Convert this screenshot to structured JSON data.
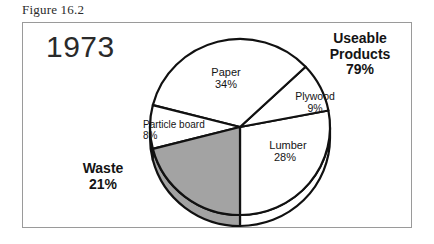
{
  "caption": "Figure 16.2",
  "year": "1973",
  "groups": {
    "useable": {
      "name": "Useable",
      "name2": "Products",
      "pct": "79%"
    },
    "waste": {
      "name": "Waste",
      "pct": "21%"
    }
  },
  "colors": {
    "waste_fill": "#a3a3a3",
    "usable_fill": "#ffffff",
    "outline": "#111111",
    "frame": "#9a9a9a",
    "text": "#141414"
  },
  "chart_data": {
    "type": "pie",
    "title": "1973",
    "xlabel": "",
    "ylabel": "",
    "legend": "none",
    "grid": false,
    "categories": [
      "Lumber",
      "Plywood",
      "Paper",
      "Particle board",
      "Waste"
    ],
    "values": [
      28,
      9,
      34,
      8,
      21
    ],
    "labels": [
      "Lumber 28%",
      "Plywood 9%",
      "Paper 34%",
      "Particle board 8%",
      "Waste 21%"
    ],
    "slice_fills": [
      "#ffffff",
      "#ffffff",
      "#ffffff",
      "#ffffff",
      "#a3a3a3"
    ],
    "annotations": [
      "Useable Products 79%",
      "Waste 21%"
    ],
    "slices": [
      {
        "label": "Lumber",
        "value": 28,
        "pct": "28%",
        "fill": "#ffffff"
      },
      {
        "label": "Plywood",
        "value": 9,
        "pct": "9%",
        "fill": "#ffffff"
      },
      {
        "label": "Paper",
        "value": 34,
        "pct": "34%",
        "fill": "#ffffff"
      },
      {
        "label": "Particle board",
        "value": 8,
        "pct": "8%",
        "fill": "#ffffff"
      },
      {
        "label": "Waste",
        "value": 21,
        "pct": "21%",
        "fill": "#a3a3a3"
      }
    ]
  }
}
